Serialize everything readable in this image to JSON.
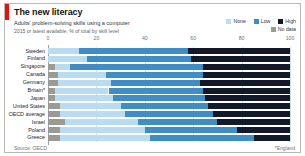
{
  "card": {
    "title": "The new literacy",
    "subtitle1": "Adults' problem-solving skills using a computer",
    "subtitle2": "2015 or latest available, % of total by skill level",
    "source": "Source: OECD",
    "footnote": "*England",
    "accent_color": "#e3120b"
  },
  "legend": {
    "row1": [
      {
        "label": "None",
        "color": "#b9dcf0"
      },
      {
        "label": "Low",
        "color": "#3e8dc6"
      },
      {
        "label": "High",
        "color": "#11192b"
      }
    ],
    "row2": [
      {
        "label": "No data",
        "color": "#9b9b95"
      }
    ]
  },
  "chart_data": {
    "type": "bar",
    "title": "The new literacy",
    "subtitle": "Adults' problem-solving skills using a computer",
    "xlabel": "",
    "ylabel": "",
    "xlim": [
      0,
      100
    ],
    "xticks": [
      0,
      20,
      40,
      60,
      80,
      100
    ],
    "ticklabels": [
      "0",
      "20",
      "40",
      "60",
      "80",
      "100"
    ],
    "grid": true,
    "legend_position": "top-right",
    "stacked": true,
    "orientation": "horizontal",
    "series": [
      {
        "name": "No data",
        "color": "#9b9b95",
        "values": [
          0,
          0,
          3,
          4,
          4,
          3,
          3,
          5,
          5,
          7,
          5,
          5
        ]
      },
      {
        "name": "None",
        "color": "#b9dcf0",
        "values": [
          13,
          16,
          6,
          20,
          22,
          22,
          24,
          25,
          27,
          30,
          35,
          37
        ]
      },
      {
        "name": "Low",
        "color": "#3e8dc6",
        "values": [
          45,
          43,
          55,
          40,
          37,
          39,
          38,
          36,
          36,
          33,
          38,
          43
        ]
      },
      {
        "name": "High",
        "color": "#11192b",
        "values": [
          42,
          41,
          36,
          36,
          37,
          36,
          35,
          34,
          32,
          30,
          22,
          15
        ]
      }
    ],
    "categories": [
      "Sweden",
      "Finland",
      "Singapore",
      "Canada",
      "Germany",
      "Britain*",
      "Japan",
      "United States",
      "OECD average",
      "Israel",
      "Poland",
      "Greece"
    ]
  }
}
